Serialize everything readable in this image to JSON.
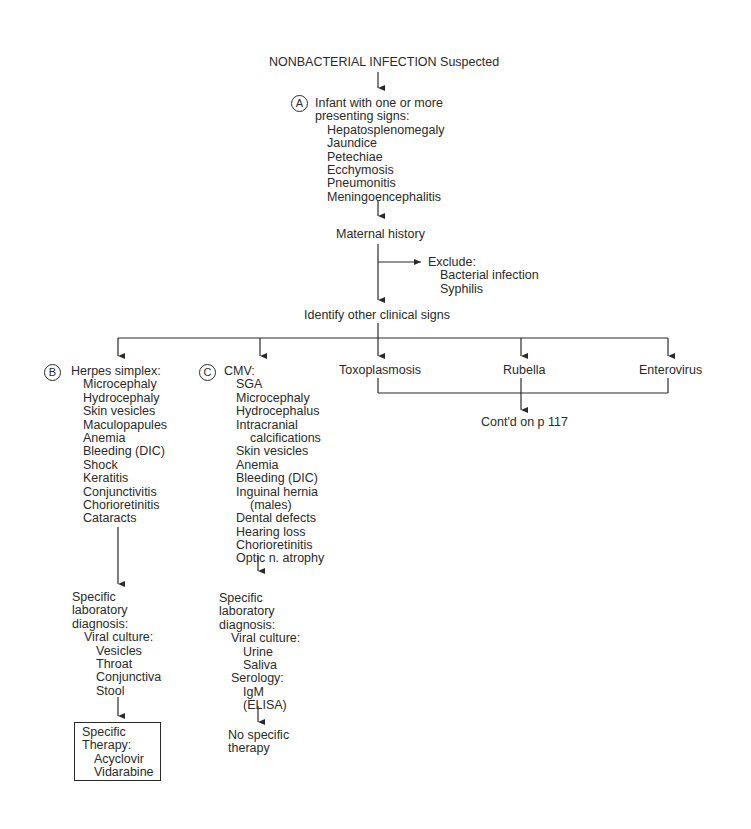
{
  "title": "NONBACTERIAL INFECTION Suspected",
  "node_a": {
    "marker": "A",
    "heading": [
      "Infant with one or more",
      "presenting signs:"
    ],
    "items": [
      "Hepatosplenomegaly",
      "Jaundice",
      "Petechiae",
      "Ecchymosis",
      "Pneumonitis",
      "Meningoencephalitis"
    ]
  },
  "maternal_history": "Maternal history",
  "exclude": {
    "label": "Exclude:",
    "items": [
      "Bacterial infection",
      "Syphilis"
    ]
  },
  "identify": "Identify other clinical signs",
  "branches": {
    "herpes": {
      "marker": "B",
      "label": "Herpes simplex:",
      "items": [
        "Microcephaly",
        "Hydrocephaly",
        "Skin vesicles",
        "Maculopapules",
        "Anemia",
        "Bleeding (DIC)",
        "Shock",
        "Keratitis",
        "Conjunctivitis",
        "Chorioretinitis",
        "Cataracts"
      ],
      "lab": {
        "heading": [
          "Specific",
          "laboratory",
          "diagnosis:"
        ],
        "viral_culture": "Viral culture:",
        "culture_items": [
          "Vesicles",
          "Throat",
          "Conjunctiva",
          "Stool"
        ]
      },
      "therapy": {
        "heading": [
          "Specific",
          "Therapy:"
        ],
        "items": [
          "Acyclovir",
          "Vidarabine"
        ]
      }
    },
    "cmv": {
      "marker": "C",
      "label": "CMV:",
      "items": [
        "SGA",
        "Microcephaly",
        "Hydrocephalus",
        "Intracranial",
        "calcifications",
        "Skin vesicles",
        "Anemia",
        "Bleeding (DIC)",
        "Inguinal hernia",
        "(males)",
        "Dental defects",
        "Hearing loss",
        "Chorioretinitis",
        "Optic n. atrophy"
      ],
      "lab": {
        "heading": [
          "Specific",
          "laboratory",
          "diagnosis:"
        ],
        "viral_culture": "Viral culture:",
        "culture_items": [
          "Urine",
          "Saliva"
        ],
        "serology": "Serology:",
        "serology_items": [
          "IgM",
          "(ELISA)"
        ]
      },
      "therapy": [
        "No specific",
        "therapy"
      ]
    },
    "toxoplasmosis": "Toxoplasmosis",
    "rubella": "Rubella",
    "enterovirus": "Enterovirus"
  },
  "continued": "Cont'd on p 117"
}
